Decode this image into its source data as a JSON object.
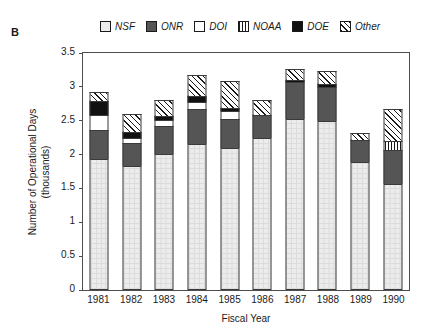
{
  "panel": {
    "label": "B"
  },
  "legend": {
    "items": [
      {
        "key": "NSF",
        "label": "NSF",
        "swatch": "light-gray-box"
      },
      {
        "key": "ONR",
        "label": "ONR",
        "swatch": "dark-gray-box"
      },
      {
        "key": "DOI",
        "label": "DOI",
        "swatch": "white-box"
      },
      {
        "key": "NOAA",
        "label": "NOAA",
        "swatch": "vertical-stripes-box"
      },
      {
        "key": "DOE",
        "label": "DOE",
        "swatch": "black-box"
      },
      {
        "key": "Other",
        "label": "Other",
        "swatch": "diagonal-hatch-box"
      }
    ]
  },
  "chart_data": {
    "type": "bar",
    "subtype": "stacked",
    "title": "",
    "xlabel": "Fiscal Year",
    "ylabel": "Number of Operational Days\n(thousands)",
    "ylabel_line1": "Number of Operational Days",
    "ylabel_line2": "(thousands)",
    "categories": [
      "1981",
      "1982",
      "1983",
      "1984",
      "1985",
      "1986",
      "1987",
      "1988",
      "1989",
      "1990"
    ],
    "ylim": [
      0,
      3.5
    ],
    "yticks": [
      0,
      0.5,
      1,
      1.5,
      2,
      2.5,
      3,
      3.5
    ],
    "ytick_labels": [
      "0",
      "0.5",
      "1",
      "1.5",
      "2",
      "2.5",
      "3",
      "3.5"
    ],
    "grid": false,
    "legend_position": "top",
    "series": [
      {
        "name": "NSF",
        "values": [
          1.93,
          1.83,
          2.01,
          2.15,
          2.1,
          2.24,
          2.52,
          2.5,
          1.89,
          1.57
        ]
      },
      {
        "name": "ONR",
        "values": [
          0.43,
          0.34,
          0.41,
          0.52,
          0.42,
          0.34,
          0.55,
          0.5,
          0.33,
          0.5
        ]
      },
      {
        "name": "DOI",
        "values": [
          0.22,
          0.07,
          0.09,
          0.1,
          0.12,
          0.0,
          0.0,
          0.0,
          0.0,
          0.0
        ]
      },
      {
        "name": "NOAA",
        "values": [
          0.0,
          0.0,
          0.0,
          0.0,
          0.0,
          0.0,
          0.0,
          0.0,
          0.0,
          0.13
        ]
      },
      {
        "name": "DOE",
        "values": [
          0.21,
          0.09,
          0.06,
          0.1,
          0.05,
          0.0,
          0.03,
          0.04,
          0.0,
          0.0
        ]
      },
      {
        "name": "Other",
        "values": [
          0.14,
          0.27,
          0.24,
          0.3,
          0.39,
          0.22,
          0.16,
          0.19,
          0.1,
          0.48
        ]
      }
    ],
    "totals": [
      2.93,
      2.6,
      2.81,
      3.17,
      3.08,
      2.8,
      3.26,
      3.23,
      2.32,
      2.68
    ]
  },
  "colors": {
    "nsf": "#ececec",
    "onr": "#555555",
    "doi": "#ffffff",
    "noaa": "#ffffff",
    "doe": "#111111",
    "other": "#ffffff",
    "outline": "#1a1a1a",
    "axis": "#4d4d4d",
    "background": "#ffffff"
  }
}
